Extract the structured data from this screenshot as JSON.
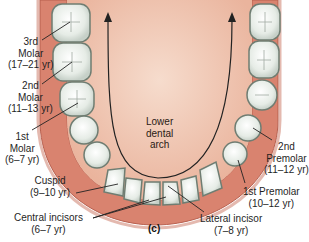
{
  "figure": {
    "panel_label": "(c)",
    "arch_label": [
      "Lower",
      "dental",
      "arch"
    ],
    "colors": {
      "gum": "#d9836f",
      "gum_dark": "#b8604f",
      "tongue": "#f0c2ad",
      "tongue_light": "#f6dccd",
      "tooth": "#eef2ee",
      "tooth_outline": "#6f7d72",
      "line": "#222222"
    },
    "labels": [
      {
        "name": "3rd Molar",
        "lines": [
          "3rd",
          "Molar",
          "(17–21 yr)"
        ]
      },
      {
        "name": "2nd Molar",
        "lines": [
          "2nd",
          "Molar",
          "(11–13 yr)"
        ]
      },
      {
        "name": "1st Molar",
        "lines": [
          "1st",
          "Molar",
          "(6–7 yr)"
        ]
      },
      {
        "name": "Cuspid",
        "lines": [
          "Cuspid",
          "(9–10 yr)"
        ]
      },
      {
        "name": "Central incisors",
        "lines": [
          "Central incisors",
          "(6–7 yr)"
        ]
      },
      {
        "name": "Lateral incisor",
        "lines": [
          "Lateral incisor",
          "(7–8 yr)"
        ]
      },
      {
        "name": "1st Premolar",
        "lines": [
          "1st Premolar",
          "(10–12 yr)"
        ]
      },
      {
        "name": "2nd Premolar",
        "lines": [
          "2nd",
          "Premolar",
          "(11–12 yr)"
        ]
      }
    ]
  }
}
